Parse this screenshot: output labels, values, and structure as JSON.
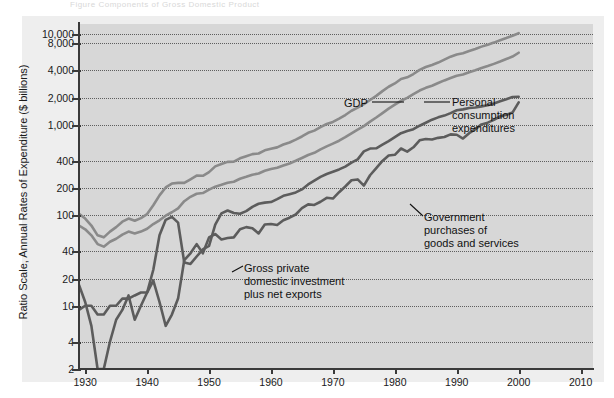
{
  "top_sliver_text": "Figure  Components of Gross Domestic Product",
  "axes": {
    "y_title": "Ratio Scale, Annual Rates of Expenditure ($ billions)",
    "y_ticks": [
      "10,000",
      "8,000",
      "4,000",
      "2,000",
      "1,000",
      "400",
      "200",
      "100",
      "40",
      "20",
      "10",
      "4",
      "2"
    ],
    "x_ticks": [
      "1930",
      "1940",
      "1950",
      "1960",
      "1970",
      "1980",
      "1990",
      "2000",
      "2010"
    ]
  },
  "annotations": {
    "gdp": "GDP",
    "pce": [
      "Personal",
      "consumption",
      "expenditures"
    ],
    "government": [
      "Government",
      "purchases of",
      "goods and services"
    ],
    "investment": [
      "Gross private",
      "domestic investment",
      "plus net exports"
    ]
  },
  "colors": {
    "plot_background": "#d7d7d7",
    "scan_margin": "#eeeeee",
    "axis": "#3a3a3a",
    "gridline": "#4a4a4a",
    "series_light": "#8a8a8a",
    "series_dark": "#5c5c5c",
    "text": "#111111"
  },
  "chart_data": {
    "type": "line",
    "title": "",
    "subtitle": "",
    "xlabel": "",
    "ylabel": "Ratio Scale, Annual Rates of Expenditure ($ billions)",
    "y_scale": "log",
    "ylim": [
      2,
      13000
    ],
    "xlim": [
      1929,
      2012
    ],
    "grid": true,
    "legend": "annotations-inline",
    "y_tick_values": [
      10000,
      8000,
      4000,
      2000,
      1000,
      400,
      200,
      100,
      40,
      20,
      10,
      4,
      2
    ],
    "x_tick_values": [
      1930,
      1940,
      1950,
      1960,
      1970,
      1980,
      1990,
      2000,
      2010
    ],
    "series": [
      {
        "name": "GDP",
        "x": [
          1929,
          1930,
          1931,
          1932,
          1933,
          1934,
          1935,
          1936,
          1937,
          1938,
          1939,
          1940,
          1941,
          1942,
          1943,
          1944,
          1945,
          1946,
          1947,
          1948,
          1949,
          1950,
          1951,
          1952,
          1953,
          1954,
          1955,
          1956,
          1957,
          1958,
          1959,
          1960,
          1961,
          1962,
          1963,
          1964,
          1965,
          1966,
          1967,
          1968,
          1969,
          1970,
          1971,
          1972,
          1973,
          1974,
          1975,
          1976,
          1977,
          1978,
          1979,
          1980,
          1981,
          1982,
          1983,
          1984,
          1985,
          1986,
          1987,
          1988,
          1989,
          1990,
          1991,
          1992,
          1993,
          1994,
          1995,
          1996,
          1997,
          1998,
          1999,
          2000
        ],
        "y": [
          104,
          92,
          77,
          60,
          57,
          66,
          74,
          85,
          92,
          87,
          93,
          103,
          129,
          166,
          203,
          224,
          228,
          228,
          250,
          275,
          273,
          300,
          347,
          368,
          389,
          391,
          426,
          450,
          474,
          482,
          522,
          543,
          563,
          605,
          638,
          685,
          743,
          815,
          862,
          943,
          1020,
          1076,
          1168,
          1282,
          1429,
          1549,
          1689,
          1878,
          2086,
          2357,
          2632,
          2863,
          3211,
          3345,
          3638,
          4041,
          4347,
          4590,
          4870,
          5253,
          5658,
          5980,
          6174,
          6539,
          6879,
          7309,
          7664,
          8100,
          8609,
          9089,
          9661,
          10290
        ]
      },
      {
        "name": "Personal consumption expenditures",
        "x": [
          1929,
          1930,
          1931,
          1932,
          1933,
          1934,
          1935,
          1936,
          1937,
          1938,
          1939,
          1940,
          1941,
          1942,
          1943,
          1944,
          1945,
          1946,
          1947,
          1948,
          1949,
          1950,
          1951,
          1952,
          1953,
          1954,
          1955,
          1956,
          1957,
          1958,
          1959,
          1960,
          1961,
          1962,
          1963,
          1964,
          1965,
          1966,
          1967,
          1968,
          1969,
          1970,
          1971,
          1972,
          1973,
          1974,
          1975,
          1976,
          1977,
          1978,
          1979,
          1980,
          1981,
          1982,
          1983,
          1984,
          1985,
          1986,
          1987,
          1988,
          1989,
          1990,
          1991,
          1992,
          1993,
          1994,
          1995,
          1996,
          1997,
          1998,
          1999,
          2000
        ],
        "y": [
          77,
          70,
          60,
          48,
          45,
          51,
          55,
          61,
          66,
          63,
          66,
          71,
          80,
          88,
          99,
          108,
          119,
          143,
          160,
          173,
          176,
          192,
          207,
          217,
          229,
          235,
          253,
          266,
          281,
          290,
          310,
          324,
          335,
          355,
          374,
          400,
          430,
          464,
          490,
          536,
          578,
          620,
          667,
          730,
          805,
          885,
          968,
          1084,
          1204,
          1346,
          1507,
          1668,
          1842,
          1987,
          2181,
          2390,
          2562,
          2704,
          2892,
          3094,
          3284,
          3486,
          3589,
          3801,
          4003,
          4232,
          4454,
          4716,
          4999,
          5331,
          5681,
          6257
        ]
      },
      {
        "name": "Gross private domestic investment plus net exports",
        "x": [
          1929,
          1930,
          1931,
          1932,
          1933,
          1934,
          1935,
          1936,
          1937,
          1938,
          1939,
          1940,
          1941,
          1942,
          1943,
          1944,
          1945,
          1946,
          1947,
          1948,
          1949,
          1950,
          1951,
          1952,
          1953,
          1954,
          1955,
          1956,
          1957,
          1958,
          1959,
          1960,
          1961,
          1962,
          1963,
          1964,
          1965,
          1966,
          1967,
          1968,
          1969,
          1970,
          1971,
          1972,
          1973,
          1974,
          1975,
          1976,
          1977,
          1978,
          1979,
          1980,
          1981,
          1982,
          1983,
          1984,
          1985,
          1986,
          1987,
          1988,
          1989,
          1990,
          1991,
          1992,
          1993,
          1994,
          1995,
          1996,
          1997,
          1998,
          1999,
          2000
        ],
        "y": [
          17,
          11,
          6,
          2,
          2,
          4,
          7,
          9,
          13,
          7,
          10,
          14,
          19,
          11,
          6,
          8,
          12,
          32,
          38,
          48,
          38,
          57,
          62,
          54,
          56,
          57,
          70,
          74,
          72,
          63,
          79,
          80,
          78,
          88,
          94,
          102,
          120,
          132,
          130,
          141,
          156,
          153,
          180,
          208,
          244,
          249,
          213,
          277,
          332,
          399,
          457,
          466,
          547,
          505,
          564,
          674,
          696,
          688,
          717,
          733,
          784,
          776,
          705,
          808,
          895,
          1010,
          1056,
          1132,
          1239,
          1288,
          1364,
          1767
        ]
      },
      {
        "name": "Government purchases of goods and services",
        "x": [
          1929,
          1930,
          1931,
          1932,
          1933,
          1934,
          1935,
          1936,
          1937,
          1938,
          1939,
          1940,
          1941,
          1942,
          1943,
          1944,
          1945,
          1946,
          1947,
          1948,
          1949,
          1950,
          1951,
          1952,
          1953,
          1954,
          1955,
          1956,
          1957,
          1958,
          1959,
          1960,
          1961,
          1962,
          1963,
          1964,
          1965,
          1966,
          1967,
          1968,
          1969,
          1970,
          1971,
          1972,
          1973,
          1974,
          1975,
          1976,
          1977,
          1978,
          1979,
          1980,
          1981,
          1982,
          1983,
          1984,
          1985,
          1986,
          1987,
          1988,
          1989,
          1990,
          1991,
          1992,
          1993,
          1994,
          1995,
          1996,
          1997,
          1998,
          1999,
          2000
        ],
        "y": [
          9,
          10,
          10,
          8,
          8,
          10,
          10,
          12,
          12,
          13,
          14,
          14,
          25,
          60,
          89,
          96,
          83,
          30,
          29,
          35,
          42,
          46,
          79,
          105,
          113,
          106,
          104,
          111,
          124,
          134,
          138,
          140,
          151,
          164,
          171,
          179,
          193,
          219,
          241,
          266,
          286,
          303,
          321,
          345,
          381,
          415,
          508,
          546,
          550,
          602,
          660,
          729,
          808,
          853,
          893,
          977,
          1053,
          1139,
          1208,
          1263,
          1347,
          1446,
          1481,
          1534,
          1555,
          1598,
          1641,
          1721,
          1823,
          1920,
          2031,
          2041
        ]
      }
    ]
  }
}
